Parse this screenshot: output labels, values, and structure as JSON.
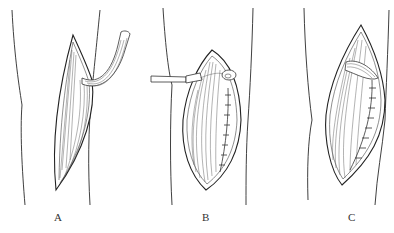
{
  "figure": {
    "panels": [
      {
        "id": "A",
        "label": "A",
        "description": "incision with tendon strip harvested and pulled out"
      },
      {
        "id": "B",
        "label": "B",
        "description": "tendon tied with forceps, incision partially sutured"
      },
      {
        "id": "C",
        "label": "C",
        "description": "tendon embedded, incision sutured"
      }
    ],
    "colors": {
      "line": "#222222",
      "background": "#ffffff"
    }
  }
}
